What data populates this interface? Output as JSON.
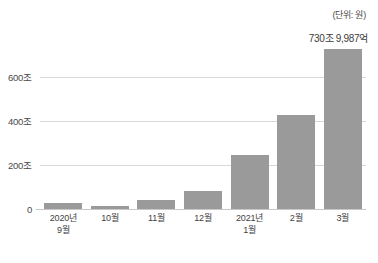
{
  "chart_data": {
    "type": "bar",
    "title": "",
    "subtitle": "",
    "unit_label": "(단위: 원)",
    "xlabel": "",
    "ylabel": "",
    "categories": [
      "2020년 9월",
      "10월",
      "11월",
      "12월",
      "2021년 1월",
      "2월",
      "3월"
    ],
    "category_lines": [
      {
        "line1": "2020년",
        "line2": "9월"
      },
      {
        "line1": "10월",
        "line2": ""
      },
      {
        "line1": "11월",
        "line2": ""
      },
      {
        "line1": "12월",
        "line2": ""
      },
      {
        "line1": "2021년",
        "line2": "1월"
      },
      {
        "line1": "2월",
        "line2": ""
      },
      {
        "line1": "3월",
        "line2": ""
      }
    ],
    "values": [
      27,
      13,
      41,
      82,
      248,
      429,
      731
    ],
    "value_unit": "조",
    "ylim": [
      0,
      770
    ],
    "yticks": [
      0,
      200,
      400,
      600
    ],
    "ytick_labels": [
      "0",
      "200조",
      "400조",
      "600조"
    ],
    "grid": true,
    "legend": "none",
    "annotations": [
      {
        "target_category": "3월",
        "text": "730조 9,987억"
      }
    ],
    "colors": {
      "bar": "#9a9a9a",
      "gridline": "#d8d8d8",
      "baseline": "#c8c8c8",
      "text": "#3a3a3a",
      "background": "#ffffff"
    }
  }
}
